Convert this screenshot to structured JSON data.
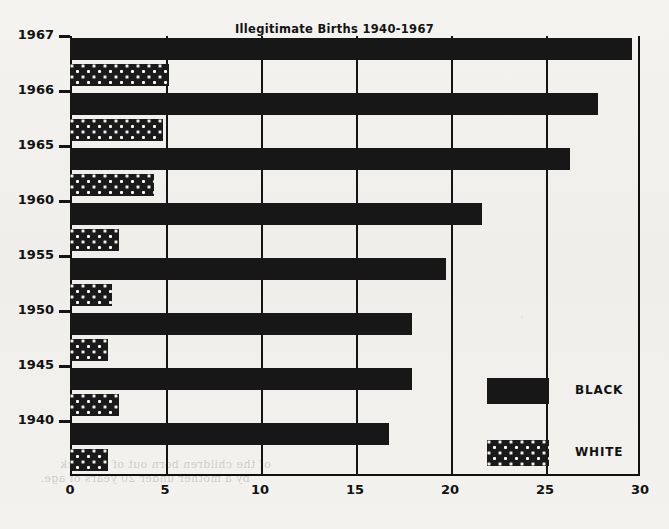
{
  "chart_data": {
    "type": "bar",
    "orientation": "horizontal",
    "title": "Illegitimate Births 1940-1967",
    "xlabel": "",
    "ylabel": "",
    "xlim": [
      0,
      30
    ],
    "xticks": [
      0,
      5,
      10,
      15,
      20,
      25,
      30
    ],
    "xtick_labels": [
      "0",
      "5",
      "10",
      "15",
      "20",
      "25",
      "30"
    ],
    "grid": true,
    "grid_axis": "x",
    "legend_position": "inside-right",
    "categories": [
      "1967",
      "1966",
      "1965",
      "1960",
      "1955",
      "1950",
      "1945",
      "1940"
    ],
    "series": [
      {
        "name": "BLACK",
        "color": "#171717",
        "fill": "solid",
        "values": [
          29.6,
          27.8,
          26.3,
          21.7,
          19.8,
          18.0,
          18.0,
          16.8
        ]
      },
      {
        "name": "WHITE",
        "color": "#1a1a1a",
        "fill": "dotted",
        "values": [
          5.2,
          4.9,
          4.4,
          2.6,
          2.2,
          2.0,
          2.6,
          2.0
        ]
      }
    ]
  },
  "legend": {
    "entries": [
      {
        "label": "BLACK",
        "swatch": "solid-black-swatch"
      },
      {
        "label": "WHITE",
        "swatch": "dotted-white-swatch"
      }
    ]
  },
  "page_ghost_text": [
    "by a mother under 20 years of age.",
    "of the children born out of wedlock"
  ]
}
